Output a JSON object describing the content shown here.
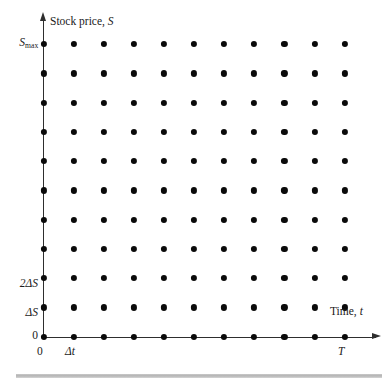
{
  "figure": {
    "type": "finite-difference-grid",
    "background_color": "#ffffff",
    "dot_color": "#0a0a0a",
    "axis_color": "#2e2e2e",
    "rule_color": "#b4b4b4"
  },
  "axes": {
    "y": {
      "title_prefix": "Stock price, ",
      "title_variable": "S",
      "arrow": "up-arrow-icon",
      "origin_label": "0",
      "ticks": [
        {
          "id": "smax",
          "text_main": "S",
          "text_sub": "max",
          "value": "S_max"
        },
        {
          "id": "two_delta_s",
          "text": "2ΔS",
          "value": "2ΔS"
        },
        {
          "id": "delta_s",
          "text": "ΔS",
          "value": "ΔS"
        },
        {
          "id": "zero",
          "text": "0",
          "value": "0"
        }
      ]
    },
    "x": {
      "title_prefix": "Time, ",
      "title_variable": "t",
      "arrow": "right-arrow-icon",
      "ticks": [
        {
          "id": "zero",
          "text": "0",
          "value": "0"
        },
        {
          "id": "delta_t",
          "text": "Δt",
          "value": "Δt"
        },
        {
          "id": "maturity",
          "text": "T",
          "value": "T"
        }
      ]
    }
  },
  "chart_data": {
    "type": "scatter",
    "title": "",
    "subtitle": "",
    "xlabel": "Time, t",
    "ylabel": "Stock price, S",
    "grid": false,
    "legend": null,
    "n_columns": 11,
    "n_rows": 11,
    "x_tick_labels": [
      "0",
      "Δt",
      "",
      "",
      "",
      "",
      "",
      "",
      "",
      "",
      "T"
    ],
    "y_tick_labels": [
      "0",
      "ΔS",
      "2ΔS",
      "",
      "",
      "",
      "",
      "",
      "",
      "",
      "S_max"
    ],
    "x_indices": [
      0,
      1,
      2,
      3,
      4,
      5,
      6,
      7,
      8,
      9,
      10
    ],
    "y_indices": [
      0,
      1,
      2,
      3,
      4,
      5,
      6,
      7,
      8,
      9,
      10
    ],
    "x_pixel_start": 43.6,
    "y_pixel_start": 336.6,
    "x_pixel_step": 30.1,
    "y_pixel_step": 29.25,
    "xlim": [
      0,
      10
    ],
    "ylim": [
      0,
      10
    ],
    "point_count": 121
  }
}
